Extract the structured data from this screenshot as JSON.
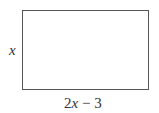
{
  "diagram": {
    "shape": "rectangle",
    "side_label": "x",
    "bottom_label": {
      "coefficient": "2",
      "variable": "x",
      "rest": " − 3"
    },
    "stroke_color": "#555555"
  }
}
